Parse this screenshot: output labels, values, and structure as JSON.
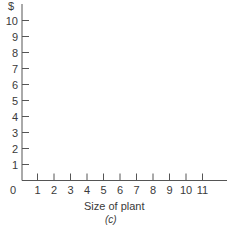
{
  "chart_data": {
    "type": "line",
    "title": "",
    "xlabel": "Size of plant",
    "ylabel": "$",
    "caption": "(c)",
    "origin_label": "0",
    "x_ticks": [
      "1",
      "2",
      "3",
      "4",
      "5",
      "6",
      "7",
      "8",
      "9",
      "10",
      "11"
    ],
    "y_ticks": [
      "1",
      "2",
      "3",
      "4",
      "5",
      "6",
      "7",
      "8",
      "9",
      "10"
    ],
    "xlim": [
      0,
      12
    ],
    "ylim": [
      0,
      10.5
    ],
    "grid": false,
    "series": [],
    "axis_color": "#555555"
  }
}
